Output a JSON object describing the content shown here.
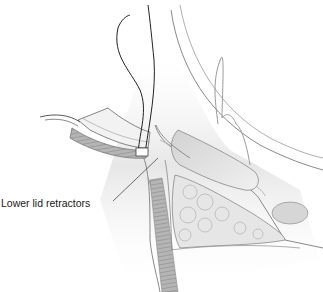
{
  "figure": {
    "labels": [
      {
        "text": "Lower lid retractors",
        "x": 1,
        "y": 197,
        "leader_to": [
          155,
          142
        ]
      }
    ]
  },
  "colors": {
    "background": "#ffffff",
    "outline": "#8a8a8a",
    "tissue_gray": "#c9c9c9",
    "muscle_dark": "#9a9a9a",
    "suture": "#222222",
    "label_text": "#1a1a1a"
  }
}
